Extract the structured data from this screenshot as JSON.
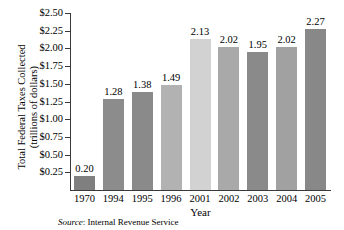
{
  "chart_data": {
    "type": "bar",
    "title": "",
    "xlabel": "Year",
    "ylabel": "Total Federal Taxes Collected (trillions of dollars)",
    "ylabel_line1": "Total Federal Taxes Collected",
    "ylabel_line2": "(trillions of dollars)",
    "categories": [
      "1970",
      "1994",
      "1995",
      "1996",
      "2001",
      "2002",
      "2003",
      "2004",
      "2005"
    ],
    "values": [
      0.2,
      1.28,
      1.38,
      1.49,
      2.13,
      2.02,
      1.95,
      2.02,
      2.27
    ],
    "value_labels": [
      "0.20",
      "1.28",
      "1.38",
      "1.49",
      "2.13",
      "2.02",
      "1.95",
      "2.02",
      "2.27"
    ],
    "bar_colors": [
      "#7f7f7f",
      "#8c8c8c",
      "#8a8a8a",
      "#b2b2b2",
      "#d2d2d2",
      "#a9a9a9",
      "#8a8a8a",
      "#a1a1a1",
      "#888888"
    ],
    "ylim": [
      0.0,
      2.5
    ],
    "ytick_values": [
      2.5,
      2.25,
      2.0,
      1.75,
      1.5,
      1.25,
      1.0,
      0.75,
      0.5,
      0.25
    ],
    "ytick_labels": [
      "$2.50",
      "$2.25",
      "$2.00",
      "$1.75",
      "$1.50",
      "$1.25",
      "$1.00",
      "$0.75",
      "$0.50",
      "$0.25"
    ],
    "grid": true,
    "grid_color": "#d2d2d2",
    "legend": "none",
    "axis_color": "#3a3a3a"
  },
  "source": {
    "prefix": "Source",
    "separator": ": ",
    "text": "Internal Revenue Service"
  }
}
